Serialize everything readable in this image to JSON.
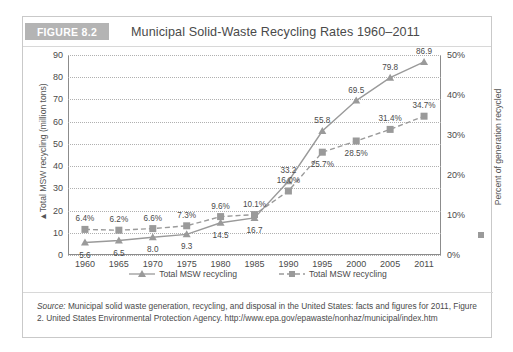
{
  "figure": {
    "badge": "FIGURE 8.2",
    "title": "Municipal Solid-Waste Recycling Rates 1960–2011"
  },
  "source": {
    "label": "Source:",
    "text": " Municipal solid waste generation, recycling, and disposal in the United States: facts and figures for 2011, Figure 2. United States Environmental Protection Agency. http://www.epa.gov/epawaste/nonhaz/municipal/index.htm"
  },
  "legend": [
    {
      "label": "Total MSW recycling",
      "marker": "triangle-marker",
      "line": "solid"
    },
    {
      "label": "Total MSW recycling",
      "marker": "square-marker",
      "line": "dashed"
    }
  ],
  "chart_data": {
    "type": "line",
    "title": "Municipal Solid-Waste Recycling Rates 1960–2011",
    "xlabel": "",
    "ylabel": "▲Total MSW recycling (million tons)",
    "y2label": "Percent of generation recycled",
    "categories": [
      "1960",
      "1965",
      "1970",
      "1975",
      "1980",
      "1985",
      "1990",
      "1995",
      "2000",
      "2005",
      "2011"
    ],
    "ylim": [
      0,
      90
    ],
    "yticks": [
      "0",
      "10",
      "20",
      "30",
      "40",
      "50",
      "60",
      "70",
      "80",
      "90"
    ],
    "y2lim": [
      0,
      50
    ],
    "y2ticks": [
      "0%",
      "10%",
      "20%",
      "30%",
      "40%",
      "50%"
    ],
    "grid": true,
    "legend_position": "bottom",
    "series": [
      {
        "name": "Total MSW recycling",
        "axis": "left",
        "unit": "million tons",
        "marker": "triangle",
        "line": "solid",
        "values": [
          5.6,
          6.5,
          8.0,
          9.3,
          14.5,
          16.7,
          33.2,
          55.8,
          69.5,
          79.8,
          86.9
        ],
        "labels": [
          "5.6",
          "6.5",
          "8.0",
          "9.3",
          "14.5",
          "16.7",
          "33.2",
          "55.8",
          "69.5",
          "79.8",
          "86.9"
        ]
      },
      {
        "name": "Total MSW recycling",
        "axis": "right",
        "unit": "percent of generation recycled",
        "marker": "square",
        "line": "dashed",
        "values": [
          6.4,
          6.2,
          6.6,
          7.3,
          9.6,
          10.1,
          16.0,
          25.7,
          28.5,
          31.4,
          34.7
        ],
        "labels": [
          "6.4%",
          "6.2%",
          "6.6%",
          "7.3%",
          "9.6%",
          "10.1%",
          "16.0%",
          "25.7%",
          "28.5%",
          "31.4%",
          "34.7%"
        ]
      }
    ]
  },
  "colors": {
    "badge_bg": "#b4b4b4",
    "series_line": "#9a9a9a",
    "grid": "#b0b0b0",
    "axis": "#8c8c8c",
    "text": "#4a4a4a"
  }
}
